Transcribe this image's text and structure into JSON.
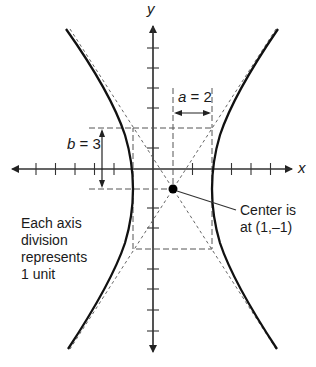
{
  "diagram": {
    "type": "hyperbola",
    "axes": {
      "x_label": "x",
      "y_label": "y"
    },
    "center": {
      "x": 1,
      "y": -1
    },
    "a": 2,
    "b": 3,
    "labels": {
      "a_var": "a",
      "a_eq": " = 2",
      "b_var": "b",
      "b_eq": " = 3",
      "center_note": "Center is\nat (1,–1)",
      "scale_note": "Each axis\ndivision\nrepresents\n1 unit"
    },
    "colors": {
      "curve": "#111111",
      "axis": "#333333",
      "dashed": "#555555"
    }
  }
}
